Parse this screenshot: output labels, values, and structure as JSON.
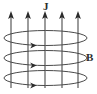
{
  "figure": {
    "background_color": "#ffffff",
    "line_color": "#4a4a4a",
    "arrow_color": "#2b2b2b",
    "label_color": "#2b2b2b",
    "width": 97,
    "height": 94
  },
  "labels": {
    "current": "J",
    "field": "B"
  },
  "current_arrows": {
    "count": 5,
    "direction": "up",
    "x_positions": [
      11,
      28,
      45,
      62,
      78
    ],
    "y_top": 12,
    "y_bottom": 88
  },
  "field_loops": {
    "count": 3,
    "direction": "clockwise-viewed-from-above",
    "center_x": 45.5,
    "radius_x": 41.5,
    "radius_y": 7.5,
    "center_y_positions": [
      38,
      58,
      78
    ],
    "arrowhead_x": 33
  }
}
